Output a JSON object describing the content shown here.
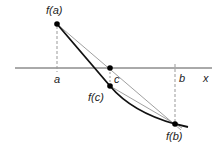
{
  "diagram": {
    "type": "secant-method-illustration",
    "labels": {
      "fa": "f(a)",
      "fb": "f(b)",
      "fc": "f(c)",
      "a": "a",
      "b": "b",
      "c": "c",
      "x_axis": "x"
    },
    "points": {
      "fa": {
        "x": 57,
        "y": 24
      },
      "c_on_axis": {
        "x": 110,
        "y": 68
      },
      "fc": {
        "x": 110,
        "y": 86
      },
      "fb": {
        "x": 175,
        "y": 124
      }
    },
    "axis": {
      "y": 68,
      "x_start": 15,
      "x_end": 212
    },
    "colors": {
      "curve": "#111111",
      "secant": "#888888",
      "axis": "#555555",
      "dashed": "#999999",
      "dot": "#000000"
    }
  }
}
